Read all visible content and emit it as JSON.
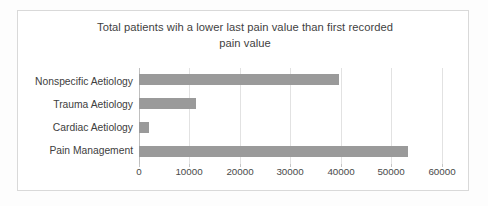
{
  "chart_data": {
    "type": "bar",
    "orientation": "horizontal",
    "title": "Total patients wih a lower last pain value than first recorded pain value",
    "title_lines": [
      "Total patients wih a lower last pain value than first recorded",
      "pain value"
    ],
    "categories": [
      "Nonspecific Aetiology",
      "Trauma Aetiology",
      "Cardiac Aetiology",
      "Pain Management"
    ],
    "values": [
      39500,
      11200,
      2000,
      53000
    ],
    "xlabel": "",
    "ylabel": "",
    "xlim": [
      0,
      60000
    ],
    "xticks": [
      0,
      10000,
      20000,
      30000,
      40000,
      50000,
      60000
    ],
    "xtick_labels": [
      "0",
      "10000",
      "20000",
      "30000",
      "40000",
      "50000",
      "60000"
    ],
    "grid": true,
    "legend": false,
    "bar_color": "#9a9a9a",
    "gridline_color": "#e2e2e2",
    "text_color": "#404040",
    "background": "#ffffff",
    "border_color": "#d9d9d9"
  }
}
